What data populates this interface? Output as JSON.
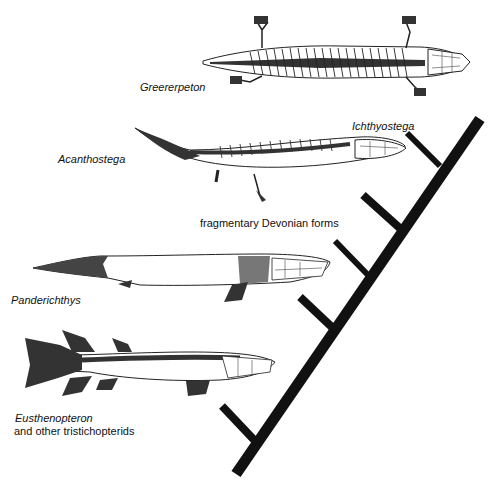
{
  "figure": {
    "type": "cladogram",
    "colors": {
      "background": "#ffffff",
      "ink": "#111111"
    }
  },
  "taxa": [
    {
      "id": "greererpeton",
      "label": "Greererpeton",
      "italic": true
    },
    {
      "id": "ichthyostega",
      "label": "Ichthyostega",
      "italic": true
    },
    {
      "id": "acanthostega",
      "label": "Acanthostega",
      "italic": true
    },
    {
      "id": "fragmentary",
      "label": "fragmentary Devonian forms",
      "italic": false
    },
    {
      "id": "panderichthys",
      "label": "Panderichthys",
      "italic": true
    },
    {
      "id": "eusthenopteron",
      "label": "Eusthenopteron",
      "italic": true,
      "sublabel": "and other tristichopterids"
    }
  ],
  "tree": {
    "branch_order_bottom_to_top": [
      "Eusthenopteron and other tristichopterids",
      "Panderichthys",
      "fragmentary Devonian forms",
      "Acanthostega",
      "Ichthyostega",
      "Greererpeton"
    ]
  }
}
